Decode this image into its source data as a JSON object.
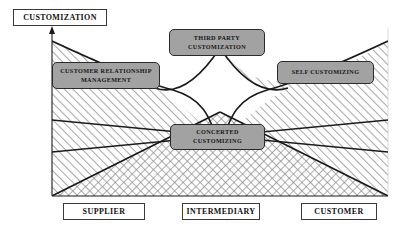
{
  "diagram": {
    "y_axis": {
      "label": "CUSTOMIZATION",
      "arrow": "up-arrow-icon"
    },
    "x_axis": {
      "categories": [
        {
          "label": "SUPPLIER"
        },
        {
          "label": "INTERMEDIARY"
        },
        {
          "label": "CUSTOMER"
        }
      ]
    },
    "nodes": [
      {
        "id": "crm",
        "label_lines": [
          "CUSTOMER RELATIONSHIP",
          "MANAGEMENT"
        ]
      },
      {
        "id": "third-party",
        "label_lines": [
          "THIRD PARTY",
          "CUSTOMIZATION"
        ]
      },
      {
        "id": "self",
        "label_lines": [
          "SELF CUSTOMIZING"
        ]
      },
      {
        "id": "concerted",
        "label_lines": [
          "CONCERTED",
          "CUSTOMIZING"
        ]
      }
    ],
    "colors": {
      "node_fill": "#a2a2a2",
      "node_stroke": "#2b2b2b",
      "line": "#1a1a1a",
      "hatch": "#6f6f6f",
      "box_border": "#3a3a3a",
      "background": "#ffffff"
    }
  }
}
